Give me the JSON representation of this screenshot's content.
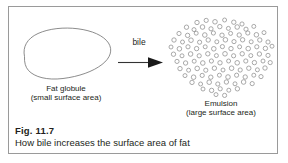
{
  "figure": {
    "number_label": "Fig. 11.7",
    "caption": "How bile increases the surface area of fat",
    "border_color": "#9a9a9a",
    "background_color": "#ffffff",
    "text_color": "#231f20"
  },
  "diagram": {
    "type": "process-diagram",
    "left_shape": {
      "name": "fat-globule",
      "shape": "irregular-blob-outline",
      "title": "Fat globule",
      "subtitle": "(small surface area)",
      "stroke_color": "#6e6e6e"
    },
    "transform_arrow": {
      "name": "bile-arrow",
      "label": "bile",
      "direction": "left-to-right",
      "color": "#1a1a1a"
    },
    "right_shape": {
      "name": "emulsion",
      "shape": "cluster-of-small-circles",
      "title": "Emulsion",
      "subtitle": "(large surface area)",
      "stroke_color": "#8d8d8d",
      "droplet_count": 118
    }
  }
}
